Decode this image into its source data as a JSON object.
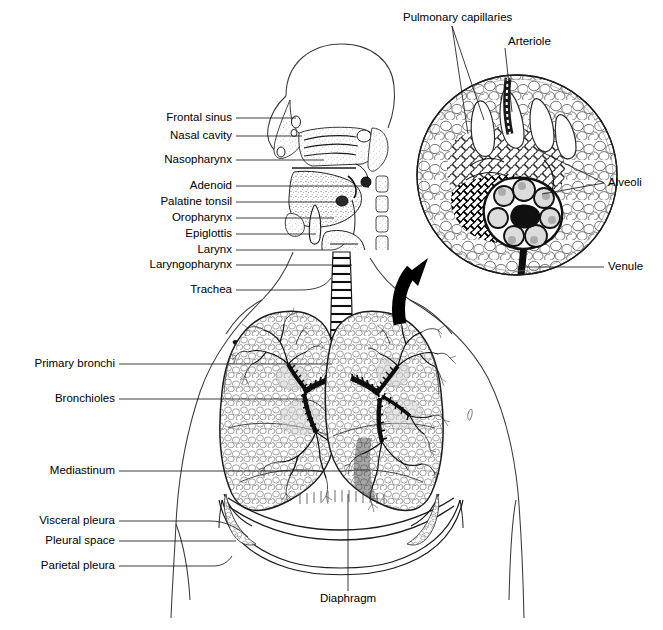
{
  "figure": {
    "title_text": "",
    "background_color": "#ffffff",
    "ink_color": "#000000",
    "width": 663,
    "height": 630
  },
  "labels": {
    "left": [
      {
        "name": "frontal-sinus",
        "text": "Frontal sinus",
        "x": 232,
        "y": 118,
        "align": "r",
        "leader": {
          "x1": 236,
          "y1": 118,
          "x2": 292,
          "y2": 118
        }
      },
      {
        "name": "nasal-cavity",
        "text": "Nasal cavity",
        "x": 232,
        "y": 136,
        "align": "r",
        "leader": {
          "x1": 236,
          "y1": 136,
          "x2": 300,
          "y2": 136
        }
      },
      {
        "name": "nasopharynx",
        "text": "Nasopharynx",
        "x": 232,
        "y": 160,
        "align": "r",
        "leader": {
          "x1": 236,
          "y1": 160,
          "x2": 322,
          "y2": 160
        }
      },
      {
        "name": "adenoid",
        "text": "Adenoid",
        "x": 232,
        "y": 186,
        "align": "r",
        "leader": {
          "x1": 236,
          "y1": 186,
          "x2": 330,
          "y2": 186
        }
      },
      {
        "name": "palatine-tonsil",
        "text": "Palatine tonsil",
        "x": 232,
        "y": 202,
        "align": "r",
        "leader": {
          "x1": 236,
          "y1": 202,
          "x2": 336,
          "y2": 202
        }
      },
      {
        "name": "oropharynx",
        "text": "Oropharynx",
        "x": 232,
        "y": 218,
        "align": "r",
        "leader": {
          "x1": 236,
          "y1": 218,
          "x2": 332,
          "y2": 218
        }
      },
      {
        "name": "epiglottis",
        "text": "Epiglottis",
        "x": 232,
        "y": 234,
        "align": "r",
        "leader": {
          "x1": 236,
          "y1": 234,
          "x2": 338,
          "y2": 234
        }
      },
      {
        "name": "larynx",
        "text": "Larynx",
        "x": 232,
        "y": 250,
        "align": "r",
        "leader": {
          "x1": 236,
          "y1": 250,
          "x2": 342,
          "y2": 250
        }
      },
      {
        "name": "laryngopharynx",
        "text": "Laryngopharynx",
        "x": 232,
        "y": 265,
        "align": "r",
        "leader": {
          "x1": 236,
          "y1": 265,
          "x2": 330,
          "y2": 265
        }
      },
      {
        "name": "trachea",
        "text": "Trachea",
        "x": 232,
        "y": 290,
        "align": "r",
        "leader": {
          "x1": 236,
          "y1": 290,
          "x2": 330,
          "y2": 290
        }
      },
      {
        "name": "primary-bronchi",
        "text": "Primary bronchi",
        "x": 115,
        "y": 364,
        "align": "r",
        "leader": {
          "x1": 119,
          "y1": 364,
          "x2": 345,
          "y2": 364
        }
      },
      {
        "name": "bronchioles",
        "text": "Bronchioles",
        "x": 115,
        "y": 399,
        "align": "r",
        "leader": {
          "x1": 119,
          "y1": 399,
          "x2": 352,
          "y2": 399
        }
      },
      {
        "name": "mediastinum",
        "text": "Mediastinum",
        "x": 115,
        "y": 471,
        "align": "r",
        "leader": {
          "x1": 119,
          "y1": 471,
          "x2": 352,
          "y2": 471
        }
      },
      {
        "name": "visceral-pleura",
        "text": "Visceral pleura",
        "x": 115,
        "y": 521,
        "align": "r",
        "leader": {
          "x1": 119,
          "y1": 521,
          "x2": 230,
          "y2": 534
        }
      },
      {
        "name": "pleural-space",
        "text": "Pleural space",
        "x": 115,
        "y": 541,
        "align": "r",
        "leader": {
          "x1": 119,
          "y1": 541,
          "x2": 228,
          "y2": 541
        }
      },
      {
        "name": "parietal-pleura",
        "text": "Parietal pleura",
        "x": 115,
        "y": 566,
        "align": "r",
        "leader": {
          "x1": 119,
          "y1": 566,
          "x2": 222,
          "y2": 562
        }
      }
    ],
    "right": [
      {
        "name": "alveoli",
        "text": "Alveoli",
        "x": 608,
        "y": 183,
        "align": "l"
      },
      {
        "name": "venule",
        "text": "Venule",
        "x": 608,
        "y": 267,
        "align": "l"
      }
    ],
    "top": [
      {
        "name": "pulmonary-capillaries",
        "text": "Pulmonary capillaries",
        "x": 403,
        "y": 18,
        "align": "l"
      },
      {
        "name": "arteriole",
        "text": "Arteriole",
        "x": 508,
        "y": 42,
        "align": "l"
      }
    ],
    "bottom": [
      {
        "name": "diaphragm",
        "text": "Diaphragm",
        "x": 348,
        "y": 599,
        "align": "c",
        "leader": {
          "x1": 348,
          "y1": 591,
          "x2": 348,
          "y2": 490
        }
      }
    ]
  },
  "annotations": {
    "magnifier_circle": {
      "name": "alveoli-magnification-circle",
      "cx": 517,
      "cy": 175,
      "r": 100
    },
    "zoom_arrow": {
      "name": "magnification-arrow",
      "from_x": 402,
      "from_y": 322,
      "to_x": 418,
      "to_y": 262
    },
    "capillary_leaders": [
      {
        "x1": 452,
        "y1": 26,
        "x2": 467,
        "y2": 133
      },
      {
        "x1": 452,
        "y1": 26,
        "x2": 480,
        "y2": 118
      }
    ],
    "arteriole_leader": {
      "x1": 505,
      "y1": 48,
      "x2": 512,
      "y2": 115
    },
    "alveoli_leaders": [
      {
        "x1": 604,
        "y1": 183,
        "x2": 536,
        "y2": 152
      },
      {
        "x1": 604,
        "y1": 183,
        "x2": 540,
        "y2": 193
      }
    ],
    "venule_leader": {
      "x1": 604,
      "y1": 267,
      "x2": 525,
      "y2": 267
    }
  }
}
